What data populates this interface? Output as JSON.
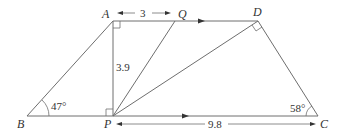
{
  "diagram": {
    "type": "geometry",
    "points": {
      "A": {
        "label": "A",
        "x": 113,
        "y": 21
      },
      "Q": {
        "label": "Q",
        "x": 175,
        "y": 21
      },
      "D": {
        "label": "D",
        "x": 258,
        "y": 21
      },
      "B": {
        "label": "B",
        "x": 27,
        "y": 116
      },
      "P": {
        "label": "P",
        "x": 113,
        "y": 116
      },
      "C": {
        "label": "C",
        "x": 318,
        "y": 116
      }
    },
    "segments": [
      "AD",
      "BC",
      "AB",
      "AP",
      "PQ",
      "PD",
      "DC"
    ],
    "parallel_marks": [
      "AD",
      "BC"
    ],
    "right_angles": [
      "A",
      "P",
      "D"
    ],
    "measurements": {
      "AQ": "3",
      "AP": "3.9",
      "PC": "9.8"
    },
    "angles": {
      "B": "47°",
      "C": "58°"
    }
  }
}
